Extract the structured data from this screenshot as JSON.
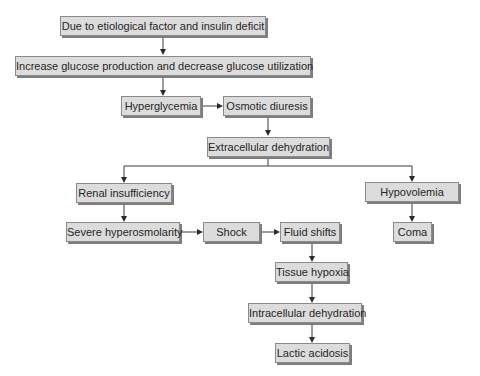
{
  "diagram": {
    "type": "flowchart",
    "nodes": {
      "cause": "Due to etiological factor and insulin deficit",
      "glucose": "Increase glucose production and decrease glucose utilization",
      "hyperglycemia": "Hyperglycemia",
      "osmotic_diuresis": "Osmotic diuresis",
      "extracellular_dehydration": "Extracellular dehydration",
      "renal_insufficiency": "Renal insufficiency",
      "hypovolemia": "Hypovolemia",
      "severe_hyperosmolarity": "Severe hyperosmolarity",
      "shock": "Shock",
      "fluid_shifts": "Fluid shifts",
      "coma": "Coma",
      "tissue_hypoxia": "Tissue hypoxia",
      "intracellular_dehydration": "Intracellular dehydration",
      "lactic_acidosis": "Lactic acidosis"
    },
    "edges": [
      [
        "cause",
        "glucose"
      ],
      [
        "glucose",
        "hyperglycemia"
      ],
      [
        "hyperglycemia",
        "osmotic_diuresis"
      ],
      [
        "osmotic_diuresis",
        "extracellular_dehydration"
      ],
      [
        "extracellular_dehydration",
        "renal_insufficiency"
      ],
      [
        "extracellular_dehydration",
        "hypovolemia"
      ],
      [
        "renal_insufficiency",
        "severe_hyperosmolarity"
      ],
      [
        "severe_hyperosmolarity",
        "shock"
      ],
      [
        "shock",
        "fluid_shifts"
      ],
      [
        "hypovolemia",
        "coma"
      ],
      [
        "fluid_shifts",
        "tissue_hypoxia"
      ],
      [
        "tissue_hypoxia",
        "intracellular_dehydration"
      ],
      [
        "intracellular_dehydration",
        "lactic_acidosis"
      ]
    ]
  }
}
